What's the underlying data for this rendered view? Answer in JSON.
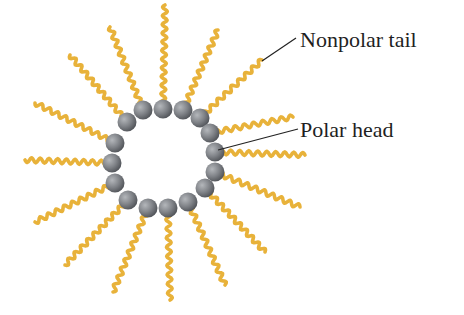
{
  "labels": {
    "nonpolar_tail": "Nonpolar tail",
    "polar_head": "Polar head"
  },
  "colors": {
    "tail": "#e8b23a",
    "tail_dark": "#c98f1c",
    "head": "#8a8d92",
    "head_dark": "#55585d",
    "leader_line": "#222222",
    "text": "#1f1f1f"
  },
  "micelle": {
    "head_count": 16,
    "heads": [
      {
        "x": 163,
        "y": 109
      },
      {
        "x": 183,
        "y": 110
      },
      {
        "x": 200,
        "y": 118
      },
      {
        "x": 210,
        "y": 133
      },
      {
        "x": 215,
        "y": 152
      },
      {
        "x": 215,
        "y": 172
      },
      {
        "x": 205,
        "y": 188
      },
      {
        "x": 188,
        "y": 202
      },
      {
        "x": 168,
        "y": 208
      },
      {
        "x": 148,
        "y": 208
      },
      {
        "x": 128,
        "y": 200
      },
      {
        "x": 115,
        "y": 183
      },
      {
        "x": 112,
        "y": 163
      },
      {
        "x": 115,
        "y": 143
      },
      {
        "x": 127,
        "y": 122
      },
      {
        "x": 143,
        "y": 110
      }
    ],
    "tail_ends": [
      {
        "x": 165,
        "y": 5
      },
      {
        "x": 218,
        "y": 30
      },
      {
        "x": 262,
        "y": 60
      },
      {
        "x": 293,
        "y": 117
      },
      {
        "x": 305,
        "y": 155
      },
      {
        "x": 300,
        "y": 207
      },
      {
        "x": 265,
        "y": 252
      },
      {
        "x": 225,
        "y": 285
      },
      {
        "x": 170,
        "y": 300
      },
      {
        "x": 113,
        "y": 292
      },
      {
        "x": 65,
        "y": 265
      },
      {
        "x": 35,
        "y": 222
      },
      {
        "x": 25,
        "y": 160
      },
      {
        "x": 35,
        "y": 103
      },
      {
        "x": 70,
        "y": 55
      },
      {
        "x": 110,
        "y": 27
      }
    ]
  }
}
